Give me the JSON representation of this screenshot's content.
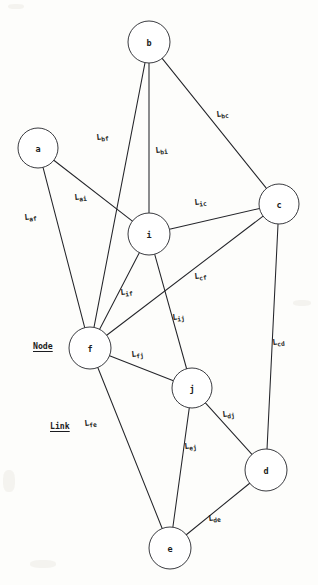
{
  "diagram": {
    "type": "graph",
    "canvas": {
      "width": 318,
      "height": 585
    },
    "stroke_color": "#24252a",
    "node_fill": "#ffffff",
    "node_stroke": "#3a3b40",
    "text_color": "#1b1c20",
    "background": "#fdfdfb",
    "nodes": [
      {
        "id": "b",
        "label": "b",
        "cx": 149,
        "cy": 42,
        "r": 21
      },
      {
        "id": "a",
        "label": "a",
        "cx": 38,
        "cy": 148,
        "r": 20
      },
      {
        "id": "c",
        "label": "c",
        "cx": 279,
        "cy": 204,
        "r": 20
      },
      {
        "id": "i",
        "label": "i",
        "cx": 149,
        "cy": 234,
        "r": 21
      },
      {
        "id": "f",
        "label": "f",
        "cx": 90,
        "cy": 348,
        "r": 21
      },
      {
        "id": "j",
        "label": "j",
        "cx": 192,
        "cy": 388,
        "r": 20
      },
      {
        "id": "d",
        "label": "d",
        "cx": 266,
        "cy": 470,
        "r": 21
      },
      {
        "id": "e",
        "label": "e",
        "cx": 170,
        "cy": 548,
        "r": 21
      }
    ],
    "links": [
      {
        "id": "L_bf",
        "from": "b",
        "to": "f",
        "label_main": "L",
        "label_sub": "bf"
      },
      {
        "id": "L_bi",
        "from": "b",
        "to": "i",
        "label_main": "L",
        "label_sub": "bi"
      },
      {
        "id": "L_bc",
        "from": "b",
        "to": "c",
        "label_main": "L",
        "label_sub": "bc"
      },
      {
        "id": "L_af",
        "from": "a",
        "to": "f",
        "label_main": "L",
        "label_sub": "af"
      },
      {
        "id": "L_ai",
        "from": "a",
        "to": "i",
        "label_main": "L",
        "label_sub": "ai"
      },
      {
        "id": "L_ic",
        "from": "i",
        "to": "c",
        "label_main": "L",
        "label_sub": "ic"
      },
      {
        "id": "L_cf",
        "from": "c",
        "to": "f",
        "label_main": "L",
        "label_sub": "cf"
      },
      {
        "id": "L_cd",
        "from": "c",
        "to": "d",
        "label_main": "L",
        "label_sub": "cd"
      },
      {
        "id": "L_if",
        "from": "i",
        "to": "f",
        "label_main": "L",
        "label_sub": "if"
      },
      {
        "id": "L_ij",
        "from": "i",
        "to": "j",
        "label_main": "L",
        "label_sub": "ij"
      },
      {
        "id": "L_fj",
        "from": "f",
        "to": "j",
        "label_main": "L",
        "label_sub": "fj"
      },
      {
        "id": "L_fe",
        "from": "f",
        "to": "e",
        "label_main": "L",
        "label_sub": "fe"
      },
      {
        "id": "L_dj",
        "from": "d",
        "to": "j",
        "label_main": "L",
        "label_sub": "dj"
      },
      {
        "id": "L_ej",
        "from": "e",
        "to": "j",
        "label_main": "L",
        "label_sub": "ej"
      },
      {
        "id": "L_de",
        "from": "d",
        "to": "e",
        "label_main": "L",
        "label_sub": "de"
      }
    ],
    "edge_label_positions": {
      "L_bf": {
        "x": 96,
        "y": 133,
        "rot": -6
      },
      "L_bi": {
        "x": 155,
        "y": 146,
        "rot": -6
      },
      "L_bc": {
        "x": 216,
        "y": 110,
        "rot": -6
      },
      "L_af": {
        "x": 24,
        "y": 213,
        "rot": -6
      },
      "L_ai": {
        "x": 74,
        "y": 193,
        "rot": -6
      },
      "L_ic": {
        "x": 194,
        "y": 198,
        "rot": -6
      },
      "L_cf": {
        "x": 194,
        "y": 272,
        "rot": -6
      },
      "L_cd": {
        "x": 272,
        "y": 338,
        "rot": -6
      },
      "L_if": {
        "x": 120,
        "y": 288,
        "rot": -6
      },
      "L_ij": {
        "x": 172,
        "y": 313,
        "rot": -6
      },
      "L_fj": {
        "x": 131,
        "y": 350,
        "rot": -6
      },
      "L_fe": {
        "x": 84,
        "y": 419,
        "rot": -6
      },
      "L_dj": {
        "x": 222,
        "y": 410,
        "rot": -6
      },
      "L_ej": {
        "x": 184,
        "y": 442,
        "rot": -6
      },
      "L_de": {
        "x": 208,
        "y": 514,
        "rot": -6
      }
    },
    "legend": [
      {
        "id": "node-legend",
        "text": "Node",
        "x": 33,
        "y": 341
      },
      {
        "id": "link-legend",
        "text": "Link",
        "x": 50,
        "y": 421
      }
    ]
  }
}
